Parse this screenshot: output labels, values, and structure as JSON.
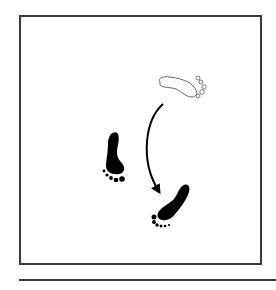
{
  "diagram": {
    "type": "dance-step-footprint-diagram",
    "frame": {
      "border_color": "#3a3a3a",
      "background": "#ffffff"
    },
    "footprints": [
      {
        "id": "start",
        "foot": "right",
        "style": "outline",
        "description": "starting position (weight-free foot, outlined)"
      },
      {
        "id": "support",
        "foot": "left",
        "style": "filled",
        "description": "supporting foot (filled)"
      },
      {
        "id": "end",
        "foot": "right",
        "style": "filled",
        "description": "step destination (filled)"
      }
    ],
    "arrows": [
      {
        "from": "start",
        "to": "end",
        "shape": "curved",
        "description": "foot moves from outline position to new position"
      }
    ],
    "colors": {
      "ink": "#000000",
      "outline": "#555555"
    }
  }
}
